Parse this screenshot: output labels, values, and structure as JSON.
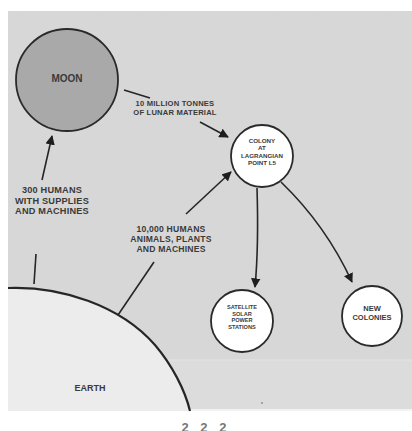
{
  "diagram": {
    "type": "flow",
    "colors": {
      "background": "#d8d8d8",
      "page": "#ffffff",
      "moon_fill": "#a9a9a9",
      "node_fill": "#ffffff",
      "earth_fill": "#ececec",
      "stroke": "#2a2a2a",
      "text": "#3a3a3a"
    },
    "nodes": {
      "moon": {
        "label": "MOON"
      },
      "colony": {
        "lines": [
          "COLONY",
          "AT",
          "LAGRANGIAN",
          "POINT L5"
        ]
      },
      "satellite": {
        "lines": [
          "SATELLITE",
          "SOLAR",
          "POWER",
          "STATIONS"
        ]
      },
      "new_colonies": {
        "lines": [
          "NEW",
          "COLONIES"
        ]
      },
      "earth": {
        "label": "EARTH"
      }
    },
    "edges": {
      "earth_to_moon": {
        "lines": [
          "300 HUMANS",
          "WITH SUPPLIES",
          "AND MACHINES"
        ]
      },
      "moon_to_colony": {
        "lines": [
          "10 MILLION TONNES",
          "OF LUNAR MATERIAL"
        ]
      },
      "earth_to_colony": {
        "lines": [
          "10,000 HUMANS",
          "ANIMALS, PLANTS",
          "AND MACHINES"
        ]
      },
      "colony_to_satellite": {
        "lines": []
      },
      "colony_to_new_colonies": {
        "lines": []
      }
    },
    "page_number_partial": "2 2 2"
  }
}
